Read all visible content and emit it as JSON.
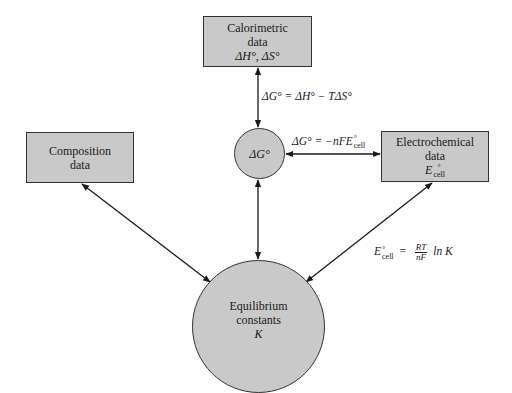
{
  "nodes": {
    "calorimetric": {
      "line1": "Calorimetric",
      "line2": "data",
      "line3": "ΔH°, ΔS°"
    },
    "delta_g": {
      "label": "ΔG°"
    },
    "composition": {
      "line1": "Composition",
      "line2": "data"
    },
    "electrochemical": {
      "line1": "Electrochemical",
      "line2": "data",
      "symbol": "E",
      "sup": "°",
      "sub": "cell"
    },
    "equilibrium": {
      "line1": "Equilibrium",
      "line2": "constants",
      "line3": "K"
    }
  },
  "equations": {
    "gibbs": "ΔG° = ΔH° − TΔS°",
    "electro_lhs": "ΔG° = −nFE",
    "electro_sup": "°",
    "electro_sub": "cell",
    "nernst_lhs": "E",
    "nernst_sup": "°",
    "nernst_sub": "cell",
    "nernst_eq": "=",
    "nernst_num": "RT",
    "nernst_den": "nF",
    "nernst_rhs": "ln K"
  },
  "colors": {
    "node_fill": "#c9c9c9",
    "stroke": "#1a1a1a"
  }
}
